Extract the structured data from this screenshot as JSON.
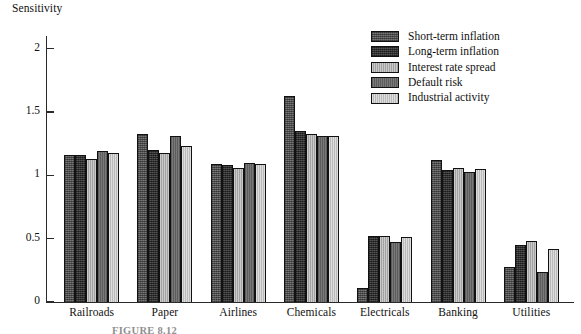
{
  "chart_data": {
    "type": "bar",
    "title": "",
    "xlabel": "",
    "ylabel": "Sensitivity",
    "ylim": [
      0,
      2.1
    ],
    "yticks": [
      "0",
      "0.5",
      "1",
      "1.5",
      "2"
    ],
    "grid": false,
    "legend_position": "upper-right",
    "categories": [
      "Railroads",
      "Paper",
      "Airlines",
      "Chemicals",
      "Electricals",
      "Banking",
      "Utilities"
    ],
    "series": [
      {
        "name": "Short-term inflation",
        "color": "#5f5f5f",
        "values": [
          1.16,
          1.33,
          1.09,
          1.63,
          0.11,
          1.12,
          0.28
        ]
      },
      {
        "name": "Long-term inflation",
        "color": "#3a3a3a",
        "values": [
          1.16,
          1.2,
          1.08,
          1.35,
          0.52,
          1.04,
          0.45
        ]
      },
      {
        "name": "Interest rate spread",
        "color": "#b4b4b4",
        "values": [
          1.13,
          1.18,
          1.06,
          1.33,
          0.52,
          1.06,
          0.48
        ]
      },
      {
        "name": "Default risk",
        "color": "#6e6e6e",
        "values": [
          1.19,
          1.31,
          1.1,
          1.31,
          0.47,
          1.03,
          0.24
        ]
      },
      {
        "name": "Industrial activity",
        "color": "#c9c9c9",
        "values": [
          1.18,
          1.23,
          1.09,
          1.31,
          0.51,
          1.05,
          0.42
        ]
      }
    ]
  },
  "figure": {
    "caption": "FIGURE 8.12"
  }
}
